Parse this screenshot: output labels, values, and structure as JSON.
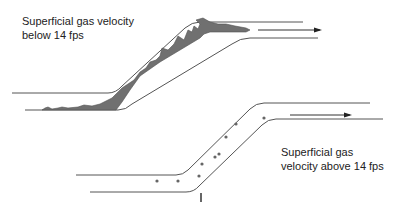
{
  "diagram": {
    "top_case": {
      "label_line1": "Superficial gas velocity",
      "label_line2": "below 14 fps",
      "description": "Liquid accumulates as stratified/slug film along lower wall"
    },
    "bottom_case": {
      "label_line1": "Superficial gas",
      "label_line2": "velocity above 14 fps",
      "description": "Liquid carried as dispersed droplets"
    },
    "flow_direction": "left-to-right",
    "colors": {
      "pipe_wall": "#555555",
      "liquid": "#707070",
      "text": "#222222",
      "droplet": "#666666"
    }
  }
}
